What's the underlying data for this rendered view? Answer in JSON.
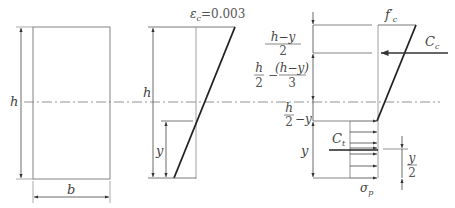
{
  "section": {
    "height_label": "h",
    "width_label": "b"
  },
  "strain": {
    "top_label_symbol": "ε",
    "top_label_sub": "c",
    "top_label_value": "=0.003",
    "height_label": "h",
    "depth_label": "y"
  },
  "stress": {
    "fc_label": "f",
    "fc_prime": "′",
    "fc_sub": "c",
    "cc_label": "C",
    "cc_sub": "c",
    "ct_label": "C",
    "ct_sub": "t",
    "sigma_label": "σ",
    "sigma_sub": "p",
    "dim1_num": "h−y",
    "dim1_den": "2",
    "dim2_a_num": "h",
    "dim2_a_den": "2",
    "dim2_minus": "−",
    "dim2_b_num": "(h−y)",
    "dim2_b_den": "3",
    "dim3_num": "h",
    "dim3_den": "2",
    "dim3_suffix": "−y",
    "dim4_label": "y",
    "half_y_num": "y",
    "half_y_den": "2"
  },
  "colors": {
    "thin_line": "#888888",
    "thick_line": "#222222",
    "text": "#444444"
  }
}
